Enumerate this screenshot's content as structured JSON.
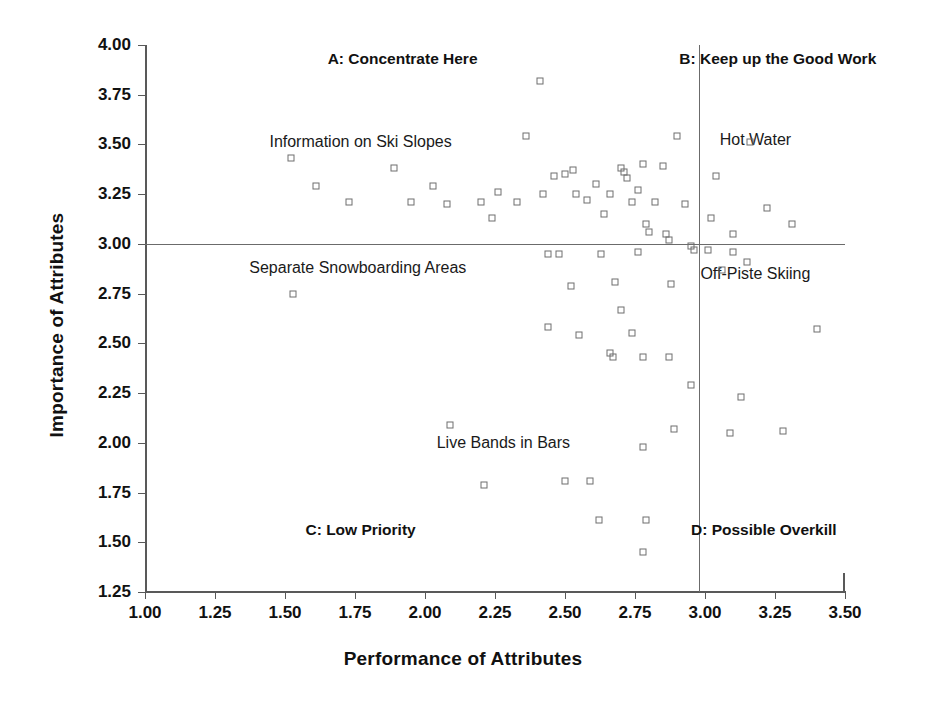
{
  "chart_data": {
    "type": "scatter",
    "title": "",
    "xlabel": "Performance of Attributes",
    "ylabel": "Importance of Attributes",
    "xlim": [
      1.0,
      3.5
    ],
    "ylim": [
      1.25,
      4.0
    ],
    "xticks": [
      "1.00",
      "1.25",
      "1.50",
      "1.75",
      "2.00",
      "2.25",
      "2.50",
      "2.75",
      "3.00",
      "3.25",
      "3.50"
    ],
    "yticks": [
      "1.25",
      "1.50",
      "1.75",
      "2.00",
      "2.25",
      "2.50",
      "2.75",
      "3.00",
      "3.25",
      "3.50",
      "3.75",
      "4.00"
    ],
    "xtick_values": [
      1.0,
      1.25,
      1.5,
      1.75,
      2.0,
      2.25,
      2.5,
      2.75,
      3.0,
      3.25,
      3.5
    ],
    "ytick_values": [
      1.25,
      1.5,
      1.75,
      2.0,
      2.25,
      2.5,
      2.75,
      3.0,
      3.25,
      3.5,
      3.75,
      4.0
    ],
    "grid": false,
    "legend": "none",
    "crosshair": {
      "x": 2.98,
      "y": 3.0
    },
    "quadrants": [
      {
        "key": "A",
        "label": "A: Concentrate Here",
        "x": 1.92,
        "y": 3.93
      },
      {
        "key": "B",
        "label": "B: Keep up the Good Work",
        "x": 3.26,
        "y": 3.93
      },
      {
        "key": "C",
        "label": "C: Low Priority",
        "x": 1.77,
        "y": 1.56
      },
      {
        "key": "D",
        "label": "D: Possible Overkill",
        "x": 3.21,
        "y": 1.56
      }
    ],
    "annotations": [
      {
        "label": "Information on Ski Slopes",
        "x": 1.77,
        "y": 3.51
      },
      {
        "label": "Separate Snowboarding Areas",
        "x": 1.76,
        "y": 2.88
      },
      {
        "label": "Hot Water",
        "x": 3.18,
        "y": 3.52
      },
      {
        "label": "Off-Piste Skiing",
        "x": 3.18,
        "y": 2.85
      },
      {
        "label": "Live Bands in Bars",
        "x": 2.28,
        "y": 2.0
      }
    ],
    "points": [
      {
        "x": 1.52,
        "y": 3.43
      },
      {
        "x": 1.61,
        "y": 3.29
      },
      {
        "x": 1.73,
        "y": 3.21
      },
      {
        "x": 1.89,
        "y": 3.38
      },
      {
        "x": 1.95,
        "y": 3.21
      },
      {
        "x": 2.03,
        "y": 3.29
      },
      {
        "x": 2.08,
        "y": 3.2
      },
      {
        "x": 2.2,
        "y": 3.21
      },
      {
        "x": 2.24,
        "y": 3.13
      },
      {
        "x": 2.26,
        "y": 3.26
      },
      {
        "x": 2.33,
        "y": 3.21
      },
      {
        "x": 2.36,
        "y": 3.54
      },
      {
        "x": 2.41,
        "y": 3.82
      },
      {
        "x": 2.42,
        "y": 3.25
      },
      {
        "x": 2.44,
        "y": 2.95
      },
      {
        "x": 2.46,
        "y": 3.34
      },
      {
        "x": 2.5,
        "y": 3.35
      },
      {
        "x": 2.53,
        "y": 3.37
      },
      {
        "x": 2.54,
        "y": 3.25
      },
      {
        "x": 2.58,
        "y": 3.22
      },
      {
        "x": 2.61,
        "y": 3.3
      },
      {
        "x": 2.64,
        "y": 3.15
      },
      {
        "x": 2.66,
        "y": 3.25
      },
      {
        "x": 2.7,
        "y": 3.38
      },
      {
        "x": 2.71,
        "y": 3.36
      },
      {
        "x": 2.72,
        "y": 3.33
      },
      {
        "x": 2.74,
        "y": 3.21
      },
      {
        "x": 2.76,
        "y": 3.27
      },
      {
        "x": 2.78,
        "y": 3.4
      },
      {
        "x": 2.79,
        "y": 3.1
      },
      {
        "x": 2.8,
        "y": 3.06
      },
      {
        "x": 2.82,
        "y": 3.21
      },
      {
        "x": 2.85,
        "y": 3.39
      },
      {
        "x": 2.86,
        "y": 3.05
      },
      {
        "x": 2.87,
        "y": 3.02
      },
      {
        "x": 2.9,
        "y": 3.54
      },
      {
        "x": 2.93,
        "y": 3.2
      },
      {
        "x": 2.95,
        "y": 2.99
      },
      {
        "x": 2.96,
        "y": 2.97
      },
      {
        "x": 3.02,
        "y": 3.13
      },
      {
        "x": 3.04,
        "y": 3.34
      },
      {
        "x": 3.1,
        "y": 3.05
      },
      {
        "x": 3.16,
        "y": 3.51
      },
      {
        "x": 3.22,
        "y": 3.18
      },
      {
        "x": 3.31,
        "y": 3.1
      },
      {
        "x": 2.48,
        "y": 2.95
      },
      {
        "x": 2.63,
        "y": 2.95
      },
      {
        "x": 2.76,
        "y": 2.96
      },
      {
        "x": 3.01,
        "y": 2.97
      },
      {
        "x": 3.1,
        "y": 2.96
      },
      {
        "x": 1.53,
        "y": 2.75
      },
      {
        "x": 2.52,
        "y": 2.79
      },
      {
        "x": 2.68,
        "y": 2.81
      },
      {
        "x": 2.88,
        "y": 2.8
      },
      {
        "x": 3.06,
        "y": 2.87
      },
      {
        "x": 3.15,
        "y": 2.91
      },
      {
        "x": 2.44,
        "y": 2.58
      },
      {
        "x": 2.55,
        "y": 2.54
      },
      {
        "x": 2.7,
        "y": 2.67
      },
      {
        "x": 2.74,
        "y": 2.55
      },
      {
        "x": 2.66,
        "y": 2.45
      },
      {
        "x": 2.67,
        "y": 2.43
      },
      {
        "x": 2.78,
        "y": 2.43
      },
      {
        "x": 2.87,
        "y": 2.43
      },
      {
        "x": 3.4,
        "y": 2.57
      },
      {
        "x": 2.95,
        "y": 2.29
      },
      {
        "x": 3.13,
        "y": 2.23
      },
      {
        "x": 2.09,
        "y": 2.09
      },
      {
        "x": 2.89,
        "y": 2.07
      },
      {
        "x": 3.09,
        "y": 2.05
      },
      {
        "x": 3.28,
        "y": 2.06
      },
      {
        "x": 2.78,
        "y": 1.98
      },
      {
        "x": 2.21,
        "y": 1.79
      },
      {
        "x": 2.5,
        "y": 1.81
      },
      {
        "x": 2.59,
        "y": 1.81
      },
      {
        "x": 2.62,
        "y": 1.61
      },
      {
        "x": 2.79,
        "y": 1.61
      },
      {
        "x": 2.78,
        "y": 1.45
      }
    ]
  }
}
